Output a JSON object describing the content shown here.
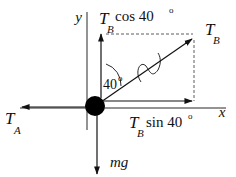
{
  "diagram": {
    "type": "free-body-diagram",
    "labels": {
      "y_axis": "y",
      "x_axis": "x",
      "tb_cos_main": "T",
      "tb_cos_sub": "B",
      "tb_cos_rest": " cos 40",
      "tb_cos_deg": "o",
      "tb_main": "T",
      "tb_sub": "B",
      "tb_sin_main": "T",
      "tb_sin_sub": "B",
      "tb_sin_rest": "sin 40",
      "tb_sin_deg": "o",
      "ta_main": "T",
      "ta_sub": "A",
      "angle_value": "40",
      "angle_deg": "o",
      "weight": "mg"
    },
    "forces": [
      {
        "name": "T_A",
        "direction": "left"
      },
      {
        "name": "T_B",
        "direction": "up-right",
        "angle_from_vertical_deg": 40
      },
      {
        "name": "T_B cos 40°",
        "direction": "up",
        "component": "vertical"
      },
      {
        "name": "T_B sin 40°",
        "direction": "right",
        "component": "horizontal"
      },
      {
        "name": "mg",
        "direction": "down"
      }
    ],
    "colors": {
      "ink": "#111111",
      "background": "#ffffff"
    }
  }
}
